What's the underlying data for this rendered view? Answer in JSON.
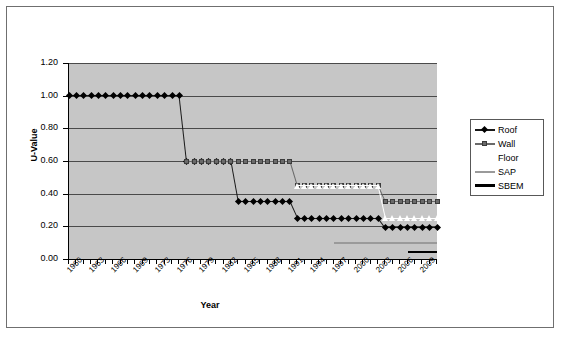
{
  "chart_data": {
    "type": "line",
    "title": "",
    "xlabel": "Year",
    "ylabel": "U-Value",
    "xlim": [
      1960,
      2010
    ],
    "ylim": [
      0.0,
      1.2
    ],
    "ytick_labels": [
      "0.00",
      "0.20",
      "0.40",
      "0.60",
      "0.80",
      "1.00",
      "1.20"
    ],
    "ytick_values": [
      0.0,
      0.2,
      0.4,
      0.6,
      0.8,
      1.0,
      1.2
    ],
    "xtick_labels": [
      "1960",
      "1963",
      "1966",
      "1969",
      "1973",
      "1976",
      "1979",
      "1982",
      "1985",
      "1988",
      "1991",
      "1994",
      "1997",
      "2000",
      "2003",
      "2006",
      "2009"
    ],
    "xtick_values": [
      1960,
      1963,
      1966,
      1969,
      1972,
      1975,
      1978,
      1981,
      1984,
      1987,
      1990,
      1993,
      1996,
      1999,
      2002,
      2005,
      2008
    ],
    "grid": "horizontal",
    "plot_background": "#c6c6c6",
    "legend_position": "right",
    "series": [
      {
        "name": "Roof",
        "marker": "diamond",
        "color": "#000000",
        "points": [
          {
            "x": 1960,
            "y": 1.0
          },
          {
            "x": 1961,
            "y": 1.0
          },
          {
            "x": 1962,
            "y": 1.0
          },
          {
            "x": 1963,
            "y": 1.0
          },
          {
            "x": 1964,
            "y": 1.0
          },
          {
            "x": 1965,
            "y": 1.0
          },
          {
            "x": 1966,
            "y": 1.0
          },
          {
            "x": 1967,
            "y": 1.0
          },
          {
            "x": 1968,
            "y": 1.0
          },
          {
            "x": 1969,
            "y": 1.0
          },
          {
            "x": 1970,
            "y": 1.0
          },
          {
            "x": 1971,
            "y": 1.0
          },
          {
            "x": 1972,
            "y": 1.0
          },
          {
            "x": 1973,
            "y": 1.0
          },
          {
            "x": 1974,
            "y": 1.0
          },
          {
            "x": 1975,
            "y": 1.0
          },
          {
            "x": 1976,
            "y": 0.6
          },
          {
            "x": 1977,
            "y": 0.6
          },
          {
            "x": 1978,
            "y": 0.6
          },
          {
            "x": 1979,
            "y": 0.6
          },
          {
            "x": 1980,
            "y": 0.6
          },
          {
            "x": 1981,
            "y": 0.6
          },
          {
            "x": 1982,
            "y": 0.6
          },
          {
            "x": 1983,
            "y": 0.35
          },
          {
            "x": 1984,
            "y": 0.35
          },
          {
            "x": 1985,
            "y": 0.35
          },
          {
            "x": 1986,
            "y": 0.35
          },
          {
            "x": 1987,
            "y": 0.35
          },
          {
            "x": 1988,
            "y": 0.35
          },
          {
            "x": 1989,
            "y": 0.35
          },
          {
            "x": 1990,
            "y": 0.35
          },
          {
            "x": 1991,
            "y": 0.25
          },
          {
            "x": 1992,
            "y": 0.25
          },
          {
            "x": 1993,
            "y": 0.25
          },
          {
            "x": 1994,
            "y": 0.25
          },
          {
            "x": 1995,
            "y": 0.25
          },
          {
            "x": 1996,
            "y": 0.25
          },
          {
            "x": 1997,
            "y": 0.25
          },
          {
            "x": 1998,
            "y": 0.25
          },
          {
            "x": 1999,
            "y": 0.25
          },
          {
            "x": 2000,
            "y": 0.25
          },
          {
            "x": 2001,
            "y": 0.25
          },
          {
            "x": 2002,
            "y": 0.25
          },
          {
            "x": 2003,
            "y": 0.19
          },
          {
            "x": 2004,
            "y": 0.19
          },
          {
            "x": 2005,
            "y": 0.19
          },
          {
            "x": 2006,
            "y": 0.19
          },
          {
            "x": 2007,
            "y": 0.19
          },
          {
            "x": 2008,
            "y": 0.19
          },
          {
            "x": 2009,
            "y": 0.19
          },
          {
            "x": 2010,
            "y": 0.19
          }
        ]
      },
      {
        "name": "Wall",
        "marker": "square",
        "color": "#6a6a6a",
        "points": [
          {
            "x": 1976,
            "y": 0.6
          },
          {
            "x": 1977,
            "y": 0.6
          },
          {
            "x": 1978,
            "y": 0.6
          },
          {
            "x": 1979,
            "y": 0.6
          },
          {
            "x": 1980,
            "y": 0.6
          },
          {
            "x": 1981,
            "y": 0.6
          },
          {
            "x": 1982,
            "y": 0.6
          },
          {
            "x": 1983,
            "y": 0.6
          },
          {
            "x": 1984,
            "y": 0.6
          },
          {
            "x": 1985,
            "y": 0.6
          },
          {
            "x": 1986,
            "y": 0.6
          },
          {
            "x": 1987,
            "y": 0.6
          },
          {
            "x": 1988,
            "y": 0.6
          },
          {
            "x": 1989,
            "y": 0.6
          },
          {
            "x": 1990,
            "y": 0.6
          },
          {
            "x": 1991,
            "y": 0.45
          },
          {
            "x": 1992,
            "y": 0.45
          },
          {
            "x": 1993,
            "y": 0.45
          },
          {
            "x": 1994,
            "y": 0.45
          },
          {
            "x": 1995,
            "y": 0.45
          },
          {
            "x": 1996,
            "y": 0.45
          },
          {
            "x": 1997,
            "y": 0.45
          },
          {
            "x": 1998,
            "y": 0.45
          },
          {
            "x": 1999,
            "y": 0.45
          },
          {
            "x": 2000,
            "y": 0.45
          },
          {
            "x": 2001,
            "y": 0.45
          },
          {
            "x": 2002,
            "y": 0.45
          },
          {
            "x": 2003,
            "y": 0.35
          },
          {
            "x": 2004,
            "y": 0.35
          },
          {
            "x": 2005,
            "y": 0.35
          },
          {
            "x": 2006,
            "y": 0.35
          },
          {
            "x": 2007,
            "y": 0.35
          },
          {
            "x": 2008,
            "y": 0.35
          },
          {
            "x": 2009,
            "y": 0.35
          },
          {
            "x": 2010,
            "y": 0.35
          }
        ]
      },
      {
        "name": "Floor",
        "marker": "triangle",
        "color": "#ffffff",
        "points": [
          {
            "x": 1991,
            "y": 0.45
          },
          {
            "x": 1992,
            "y": 0.45
          },
          {
            "x": 1993,
            "y": 0.45
          },
          {
            "x": 1994,
            "y": 0.45
          },
          {
            "x": 1995,
            "y": 0.45
          },
          {
            "x": 1996,
            "y": 0.45
          },
          {
            "x": 1997,
            "y": 0.45
          },
          {
            "x": 1998,
            "y": 0.45
          },
          {
            "x": 1999,
            "y": 0.45
          },
          {
            "x": 2000,
            "y": 0.45
          },
          {
            "x": 2001,
            "y": 0.45
          },
          {
            "x": 2002,
            "y": 0.45
          },
          {
            "x": 2003,
            "y": 0.25
          },
          {
            "x": 2004,
            "y": 0.25
          },
          {
            "x": 2005,
            "y": 0.25
          },
          {
            "x": 2006,
            "y": 0.25
          },
          {
            "x": 2007,
            "y": 0.25
          },
          {
            "x": 2008,
            "y": 0.25
          },
          {
            "x": 2009,
            "y": 0.25
          },
          {
            "x": 2010,
            "y": 0.25
          }
        ]
      },
      {
        "name": "SAP",
        "marker": "none",
        "color": "#9a9a9a",
        "points": [
          {
            "x": 1996,
            "y": 0.1
          },
          {
            "x": 2010,
            "y": 0.1
          }
        ]
      },
      {
        "name": "SBEM",
        "marker": "none",
        "color": "#000000",
        "points": [
          {
            "x": 2006,
            "y": 0.04
          },
          {
            "x": 2010,
            "y": 0.04
          }
        ]
      }
    ]
  },
  "legend": {
    "items": [
      {
        "label": "Roof"
      },
      {
        "label": "Wall"
      },
      {
        "label": "Floor"
      },
      {
        "label": "SAP"
      },
      {
        "label": "SBEM"
      }
    ]
  }
}
